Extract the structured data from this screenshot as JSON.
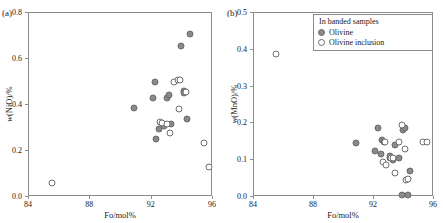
{
  "figure": {
    "panel_a_label": "(a)",
    "panel_b_label": "(b)"
  },
  "legend": {
    "title": "In banded samples",
    "items": [
      {
        "label": "Olivine",
        "marker": "filled-circle",
        "color": "#8a8a8a"
      },
      {
        "label": "Olivine inclusion",
        "marker": "open-circle",
        "color": "#ffffff"
      }
    ]
  },
  "chart_data": [
    {
      "type": "scatter",
      "panel": "(a)",
      "title": "",
      "xlabel": "Fo/mol%",
      "ylabel": "w(NiO)/%",
      "xlim": [
        84,
        96
      ],
      "ylim": [
        0.0,
        0.8
      ],
      "xticks": [
        "84",
        "88",
        "92",
        "96"
      ],
      "xtick_values": [
        84,
        88,
        92,
        96
      ],
      "yticks": [
        "0.0",
        "0.2",
        "0.4",
        "0.6",
        "0.8"
      ],
      "ytick_values": [
        0.0,
        0.2,
        0.4,
        0.6,
        0.8
      ],
      "grid": false,
      "legend_position": "none",
      "series": [
        {
          "name": "Olivine",
          "marker": "filled-circle",
          "points": [
            [
              90.9,
              0.382
            ],
            [
              92.15,
              0.428
            ],
            [
              92.3,
              0.495
            ],
            [
              92.35,
              0.246
            ],
            [
              92.55,
              0.292
            ],
            [
              92.9,
              0.305
            ],
            [
              93.05,
              0.428
            ],
            [
              93.2,
              0.438
            ],
            [
              93.3,
              0.315
            ],
            [
              94.0,
              0.651
            ],
            [
              94.15,
              0.455
            ],
            [
              94.2,
              0.447
            ],
            [
              94.4,
              0.334
            ],
            [
              94.55,
              0.706
            ]
          ]
        },
        {
          "name": "Olivine inclusion",
          "marker": "open-circle",
          "points": [
            [
              85.55,
              0.056
            ],
            [
              92.6,
              0.322
            ],
            [
              92.75,
              0.318
            ],
            [
              93.05,
              0.312
            ],
            [
              93.25,
              0.272
            ],
            [
              93.5,
              0.497
            ],
            [
              93.75,
              0.503
            ],
            [
              93.9,
              0.503
            ],
            [
              93.85,
              0.378
            ],
            [
              94.3,
              0.452
            ],
            [
              95.5,
              0.232
            ],
            [
              95.8,
              0.126
            ]
          ]
        }
      ]
    },
    {
      "type": "scatter",
      "panel": "(b)",
      "title": "",
      "xlabel": "Fo/mol%",
      "ylabel": "w(MnO)/%",
      "xlim": [
        84,
        96
      ],
      "ylim": [
        0.0,
        0.5
      ],
      "xticks": [
        "84",
        "88",
        "92",
        "96"
      ],
      "xtick_values": [
        84,
        88,
        92,
        96
      ],
      "yticks": [
        "0.0",
        "0.1",
        "0.2",
        "0.3",
        "0.4",
        "0.5"
      ],
      "ytick_values": [
        0.0,
        0.1,
        0.2,
        0.3,
        0.4,
        0.5
      ],
      "grid": false,
      "legend_position": "top-right",
      "series": [
        {
          "name": "Olivine",
          "marker": "filled-circle",
          "points": [
            [
              90.85,
              0.144
            ],
            [
              92.1,
              0.121
            ],
            [
              92.35,
              0.185
            ],
            [
              92.6,
              0.152
            ],
            [
              92.75,
              0.148
            ],
            [
              92.5,
              0.115
            ],
            [
              93.1,
              0.103
            ],
            [
              93.15,
              0.108
            ],
            [
              93.35,
              0.098
            ],
            [
              93.45,
              0.138
            ],
            [
              93.7,
              0.102
            ],
            [
              94.0,
              0.178
            ],
            [
              94.1,
              0.186
            ],
            [
              94.45,
              0.068
            ],
            [
              93.95,
              0.004
            ],
            [
              94.3,
              0.004
            ]
          ]
        },
        {
          "name": "Olivine inclusion",
          "marker": "open-circle",
          "points": [
            [
              85.5,
              0.385
            ],
            [
              92.65,
              0.092
            ],
            [
              92.8,
              0.148
            ],
            [
              92.85,
              0.085
            ],
            [
              93.2,
              0.102
            ],
            [
              93.35,
              0.104
            ],
            [
              93.45,
              0.062
            ],
            [
              93.9,
              0.193
            ],
            [
              93.75,
              0.148
            ],
            [
              94.15,
              0.128
            ],
            [
              94.2,
              0.043
            ],
            [
              94.35,
              0.046
            ],
            [
              95.3,
              0.147
            ],
            [
              95.6,
              0.147
            ]
          ]
        }
      ]
    }
  ]
}
